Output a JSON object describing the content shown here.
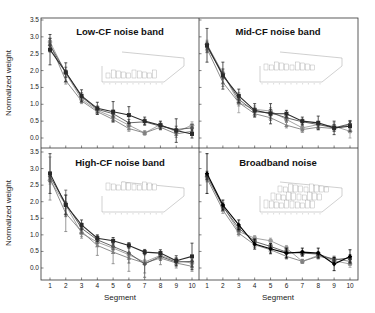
{
  "chart_data": {
    "type": "line",
    "layout": "2x2 panels, shared axes",
    "xlabel": "Segment",
    "ylabel": "Normalized weight",
    "x": [
      1,
      2,
      3,
      4,
      5,
      6,
      7,
      8,
      9,
      10
    ],
    "x_tick_labels": [
      "1",
      "2",
      "3",
      "4",
      "5",
      "6",
      "7",
      "8",
      "9",
      "10"
    ],
    "ylim": [
      -0.3,
      3.5
    ],
    "y_ticks": [
      0.0,
      0.5,
      1.0,
      1.5,
      2.0,
      2.5,
      3.0,
      3.5
    ],
    "y_tick_labels": [
      "0.0",
      "0.5",
      "1.0",
      "1.5",
      "2.0",
      "2.5",
      "3.0",
      "3.5"
    ],
    "grid": false,
    "legend": "none (series shown in grayscale; inset 3D bar plots per panel)",
    "panels": [
      {
        "title": "Low-CF noise band",
        "position": "top-left",
        "series": [
          {
            "name": "series 1 (dark)",
            "color": "#2a2a2a",
            "marker": "square",
            "values": [
              2.62,
              1.95,
              1.25,
              0.88,
              0.78,
              0.68,
              0.5,
              0.38,
              0.22,
              0.12
            ],
            "errors": [
              0.45,
              0.28,
              0.18,
              0.18,
              0.3,
              0.25,
              0.12,
              0.12,
              0.35,
              0.12
            ]
          },
          {
            "name": "series 2",
            "color": "#555555",
            "marker": "diamond",
            "values": [
              2.75,
              1.95,
              1.22,
              0.85,
              0.72,
              0.45,
              0.48,
              0.35,
              0.25,
              0.3
            ],
            "errors": [
              0.2,
              0.15,
              0.12,
              0.1,
              0.1,
              0.1,
              0.08,
              0.08,
              0.1,
              0.1
            ]
          },
          {
            "name": "series 3",
            "color": "#808080",
            "marker": "triangle",
            "values": [
              2.8,
              1.7,
              1.1,
              0.78,
              0.55,
              0.28,
              0.15,
              0.32,
              0.12,
              0.2
            ],
            "errors": [
              0.15,
              0.1,
              0.08,
              0.08,
              0.08,
              0.08,
              0.06,
              0.08,
              0.1,
              0.1
            ]
          },
          {
            "name": "series 4 (light)",
            "color": "#9a9a9a",
            "marker": "circle",
            "values": [
              2.85,
              1.92,
              1.15,
              0.82,
              0.62,
              0.38,
              0.15,
              0.4,
              0.18,
              0.38
            ],
            "errors": [
              0.12,
              0.1,
              0.08,
              0.08,
              0.08,
              0.08,
              0.06,
              0.08,
              0.1,
              0.1
            ]
          }
        ]
      },
      {
        "title": "Mid-CF noise band",
        "position": "top-right",
        "series": [
          {
            "name": "series 1 (dark)",
            "color": "#2a2a2a",
            "marker": "square",
            "values": [
              2.75,
              1.85,
              1.25,
              0.82,
              0.72,
              0.72,
              0.5,
              0.45,
              0.3,
              0.35
            ],
            "errors": [
              0.5,
              0.4,
              0.2,
              0.2,
              0.3,
              0.1,
              0.12,
              0.2,
              0.2,
              0.15
            ]
          },
          {
            "name": "series 2",
            "color": "#555555",
            "marker": "diamond",
            "values": [
              2.7,
              1.9,
              1.15,
              0.78,
              0.75,
              0.6,
              0.48,
              0.4,
              0.3,
              0.42
            ],
            "errors": [
              0.15,
              0.15,
              0.12,
              0.1,
              0.1,
              0.1,
              0.08,
              0.08,
              0.1,
              0.1
            ]
          },
          {
            "name": "series 3",
            "color": "#808080",
            "marker": "triangle",
            "values": [
              2.65,
              1.65,
              1.05,
              0.72,
              0.6,
              0.38,
              0.25,
              0.32,
              0.28,
              0.4
            ],
            "errors": [
              0.12,
              0.12,
              0.1,
              0.08,
              0.08,
              0.08,
              0.08,
              0.08,
              0.08,
              0.1
            ]
          },
          {
            "name": "series 4 (light)",
            "color": "#9a9a9a",
            "marker": "circle",
            "values": [
              2.78,
              1.92,
              1.05,
              0.85,
              0.8,
              0.55,
              0.3,
              0.4,
              0.35,
              0.2
            ],
            "errors": [
              0.12,
              0.1,
              0.3,
              0.1,
              0.1,
              0.08,
              0.12,
              0.1,
              0.1,
              0.2
            ]
          }
        ]
      },
      {
        "title": "High-CF noise band",
        "position": "bottom-left",
        "series": [
          {
            "name": "series 1 (dark)",
            "color": "#2a2a2a",
            "marker": "square",
            "values": [
              2.85,
              1.9,
              1.3,
              0.9,
              0.82,
              0.68,
              0.48,
              0.45,
              0.22,
              0.35
            ],
            "errors": [
              0.6,
              0.3,
              0.15,
              0.1,
              0.1,
              0.08,
              0.08,
              0.1,
              0.15,
              0.4
            ]
          },
          {
            "name": "series 2",
            "color": "#555555",
            "marker": "diamond",
            "values": [
              2.75,
              1.95,
              1.2,
              0.85,
              0.65,
              0.45,
              0.12,
              0.35,
              0.18,
              0.2
            ],
            "errors": [
              0.15,
              0.4,
              0.15,
              0.1,
              0.1,
              0.3,
              0.4,
              0.12,
              0.12,
              0.15
            ]
          },
          {
            "name": "series 3",
            "color": "#808080",
            "marker": "triangle",
            "values": [
              2.7,
              1.65,
              1.1,
              0.68,
              0.48,
              0.3,
              0.15,
              0.3,
              0.15,
              0.05
            ],
            "errors": [
              0.65,
              0.55,
              0.2,
              0.3,
              0.35,
              0.4,
              0.3,
              0.2,
              0.15,
              0.15
            ]
          },
          {
            "name": "series 4 (light)",
            "color": "#9a9a9a",
            "marker": "circle",
            "values": [
              2.65,
              1.9,
              1.05,
              0.78,
              0.6,
              0.4,
              0.18,
              0.38,
              0.22,
              0.15
            ],
            "errors": [
              0.12,
              0.1,
              0.1,
              0.08,
              0.08,
              0.08,
              0.08,
              0.08,
              0.08,
              0.1
            ]
          }
        ]
      },
      {
        "title": "Broadband noise",
        "position": "bottom-right",
        "series": [
          {
            "name": "series 1 (black)",
            "color": "#000000",
            "marker": "diamond",
            "values": [
              2.85,
              1.9,
              1.3,
              0.72,
              0.58,
              0.45,
              0.48,
              0.45,
              0.12,
              0.35
            ],
            "errors": [
              0.6,
              0.15,
              0.15,
              0.15,
              0.15,
              0.15,
              0.12,
              0.15,
              0.2,
              0.2
            ]
          },
          {
            "name": "series 2",
            "color": "#555555",
            "marker": "square",
            "values": [
              2.8,
              1.85,
              1.2,
              0.8,
              0.65,
              0.48,
              0.45,
              0.42,
              0.25,
              0.3
            ],
            "errors": [
              0.12,
              0.1,
              0.1,
              0.08,
              0.08,
              0.08,
              0.08,
              0.08,
              0.08,
              0.1
            ]
          },
          {
            "name": "series 3",
            "color": "#808080",
            "marker": "triangle",
            "values": [
              2.7,
              1.75,
              1.05,
              0.7,
              0.55,
              0.35,
              0.2,
              0.35,
              0.28,
              0.2
            ],
            "errors": [
              0.1,
              0.1,
              0.08,
              0.08,
              0.08,
              0.08,
              0.06,
              0.08,
              0.08,
              0.1
            ]
          },
          {
            "name": "series 4 (light)",
            "color": "#9a9a9a",
            "marker": "circle",
            "values": [
              2.75,
              1.88,
              1.1,
              0.9,
              0.82,
              0.6,
              0.2,
              0.38,
              0.22,
              0.12
            ],
            "errors": [
              0.1,
              0.1,
              0.08,
              0.08,
              0.08,
              0.08,
              0.06,
              0.08,
              0.08,
              0.1
            ]
          }
        ]
      }
    ]
  }
}
